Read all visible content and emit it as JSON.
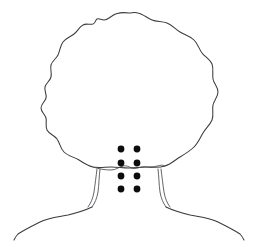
{
  "figure": {
    "title": "Back of head, neck and shoulders line drawing",
    "view": "posterior",
    "background_color": "#ffffff",
    "line_color": "#3c3a3e",
    "marker_color": "#0d0d0d",
    "canvas": {
      "width": 262,
      "height": 247
    }
  },
  "parts": [
    {
      "id": "hair-outline",
      "label": "Hair outline"
    },
    {
      "id": "hairline-nape",
      "label": "Nape hairline"
    },
    {
      "id": "neck-left",
      "label": "Left neck contour"
    },
    {
      "id": "neck-right",
      "label": "Right neck contour"
    },
    {
      "id": "shoulder-left",
      "label": "Left shoulder"
    },
    {
      "id": "shoulder-right",
      "label": "Right shoulder"
    },
    {
      "id": "marker-grid",
      "label": "Injection point grid"
    }
  ],
  "markers": {
    "label": "Treatment points",
    "count": 8,
    "rows": 4,
    "columns": 2,
    "radius": 3.4,
    "color": "#0d0d0d",
    "points": [
      {
        "id": "p1",
        "row": 1,
        "column": 1,
        "cx": 121,
        "cy": 149
      },
      {
        "id": "p2",
        "row": 1,
        "column": 2,
        "cx": 137,
        "cy": 149
      },
      {
        "id": "p3",
        "row": 2,
        "column": 1,
        "cx": 121,
        "cy": 163
      },
      {
        "id": "p4",
        "row": 2,
        "column": 2,
        "cx": 137,
        "cy": 163
      },
      {
        "id": "p5",
        "row": 3,
        "column": 1,
        "cx": 121,
        "cy": 176
      },
      {
        "id": "p6",
        "row": 3,
        "column": 2,
        "cx": 137,
        "cy": 176
      },
      {
        "id": "p7",
        "row": 4,
        "column": 1,
        "cx": 121,
        "cy": 189
      },
      {
        "id": "p8",
        "row": 4,
        "column": 2,
        "cx": 137,
        "cy": 189
      }
    ]
  },
  "paths": {
    "hair_outline": "M 129 13 C 122 12 116 13 112 16 C 109 18 107 20 104 20 C 101 20 99 18 97 19 C 95 20 96 23 93 24 C 89 25 86 23 83 25 C 79 27 78 31 74 34 C 70 37 66 38 63 42 C 60 46 60 51 58 55 C 56 59 52 61 51 65 C 50 69 52 73 51 77 C 50 81 46 83 45 87 C 44 91 47 94 46 98 C 45 102 41 104 41 108 C 41 112 45 114 46 118 C 47 122 45 126 47 130 C 49 134 54 135 57 139 C 60 143 60 148 64 152 C 68 156 74 157 79 160 C 84 163 88 166 93 167 C 99 168 105 167 111 167 C 117 167 123 168 129 168 C 135 168 141 167 147 167 C 153 167 159 168 165 166 C 171 164 175 160 180 157 C 185 154 190 151 194 147 C 198 143 200 138 203 133 C 206 128 210 125 212 120 C 214 115 212 110 213 105 C 214 100 218 97 218 92 C 218 87 214 84 213 79 C 212 74 214 69 212 64 C 210 59 205 57 202 53 C 199 49 198 44 194 40 C 190 36 185 35 180 32 C 175 29 172 25 167 23 C 162 21 157 22 152 20 C 147 18 143 14 138 13 C 135 12 132 13 129 13 Z",
    "hairline_nape": "M 93 167 C 99 169 105 170 111 170 C 116 170 119 167 123 166 C 126 165 129 167 132 168 C 135 169 138 168 141 167 C 145 166 149 168 153 167 C 158 166 162 164 165 166",
    "neck_left_outer": "M 97 169 C 96 177 95 185 94 192 C 93 198 91 203 88 207",
    "neck_left_inner": "M 100 169 C 99 177 99 185 98 192 C 97 198 95 203 92 207",
    "neck_right_outer": "M 161 169 C 162 177 163 185 164 192 C 165 198 167 203 170 207",
    "neck_right_inner": "M 158 169 C 159 177 159 185 160 192 C 161 198 163 203 166 207",
    "shoulder_left": "M 92 207 C 84 211 76 213 68 215 C 58 217 48 218 40 222 C 32 226 24 230 18 234 C 16 236 15 238 14 240",
    "shoulder_right": "M 166 207 C 174 211 182 213 190 215 C 200 217 210 218 218 222 C 226 226 234 230 240 234 C 242 236 243 238 244 240"
  }
}
